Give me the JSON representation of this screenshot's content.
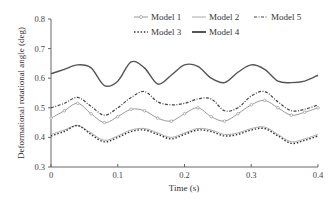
{
  "chart_data": {
    "type": "line",
    "title": "",
    "xlabel": "Time (s)",
    "ylabel": "Deformational rotational angle (deg)",
    "xlim": [
      0,
      0.4
    ],
    "ylim": [
      0.3,
      0.8
    ],
    "xticks": [
      "0",
      "0.1",
      "0.2",
      "0.3",
      "0.4"
    ],
    "yticks": [
      "0.3",
      "0.4",
      "0.5",
      "0.6",
      "0.7",
      "0.8"
    ],
    "grid": false,
    "legend_position": "top",
    "x": [
      0,
      0.02,
      0.04,
      0.06,
      0.08,
      0.1,
      0.12,
      0.14,
      0.16,
      0.18,
      0.2,
      0.22,
      0.24,
      0.26,
      0.28,
      0.3,
      0.32,
      0.34,
      0.36,
      0.38,
      0.4
    ],
    "series": [
      {
        "name": "Model 1",
        "style": "line-circle",
        "color": "#999999",
        "values": [
          0.465,
          0.49,
          0.515,
          0.48,
          0.45,
          0.47,
          0.495,
          0.49,
          0.465,
          0.455,
          0.48,
          0.5,
          0.47,
          0.455,
          0.48,
          0.51,
          0.525,
          0.5,
          0.475,
          0.485,
          0.5
        ]
      },
      {
        "name": "Model 2",
        "style": "solid-thin",
        "color": "#aaaaaa",
        "values": [
          0.41,
          0.425,
          0.44,
          0.415,
          0.39,
          0.405,
          0.425,
          0.43,
          0.415,
          0.4,
          0.415,
          0.43,
          0.425,
          0.41,
          0.415,
          0.43,
          0.435,
          0.41,
          0.385,
          0.395,
          0.41
        ]
      },
      {
        "name": "Model 3",
        "style": "dotted",
        "color": "#333333",
        "values": [
          0.405,
          0.42,
          0.44,
          0.41,
          0.385,
          0.4,
          0.42,
          0.425,
          0.41,
          0.395,
          0.41,
          0.425,
          0.42,
          0.405,
          0.41,
          0.425,
          0.43,
          0.405,
          0.38,
          0.39,
          0.405
        ]
      },
      {
        "name": "Model 4",
        "style": "solid-thick",
        "color": "#555555",
        "values": [
          0.615,
          0.63,
          0.645,
          0.635,
          0.575,
          0.59,
          0.655,
          0.635,
          0.58,
          0.61,
          0.645,
          0.64,
          0.6,
          0.585,
          0.62,
          0.645,
          0.63,
          0.59,
          0.585,
          0.59,
          0.61
        ]
      },
      {
        "name": "Model 5",
        "style": "dash-dot",
        "color": "#444444",
        "values": [
          0.5,
          0.515,
          0.535,
          0.505,
          0.475,
          0.5,
          0.535,
          0.555,
          0.52,
          0.51,
          0.515,
          0.53,
          0.53,
          0.49,
          0.5,
          0.54,
          0.555,
          0.52,
          0.49,
          0.495,
          0.51
        ]
      }
    ]
  }
}
